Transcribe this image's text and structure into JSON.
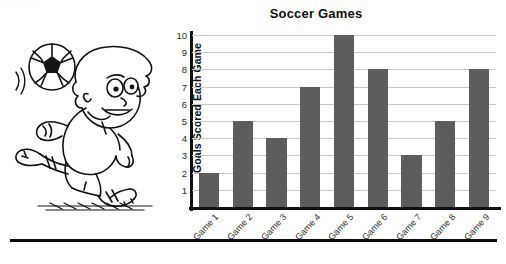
{
  "chart_data": {
    "type": "bar",
    "title": "Soccer Games",
    "xlabel": "",
    "ylabel": "Goals Scored Each Game",
    "categories": [
      "Game 1",
      "Game 2",
      "Game 3",
      "Game 4",
      "Game 5",
      "Game 6",
      "Game 7",
      "Game 8",
      "Game 9"
    ],
    "values": [
      2,
      5,
      4,
      7,
      10,
      8,
      3,
      5,
      8
    ],
    "ylim": [
      0,
      10
    ],
    "ytick_labels": [
      "1",
      "2",
      "3",
      "4",
      "5",
      "6",
      "7",
      "8",
      "9",
      "10"
    ],
    "ytick_values": [
      1,
      2,
      3,
      4,
      5,
      6,
      7,
      8,
      9,
      10
    ],
    "grid": true,
    "legend": false,
    "bar_color": "#5d5d5d",
    "grid_color": "#c9c9c9",
    "axis_color": "#101010"
  },
  "illustration": {
    "name": "soccer-player-line-art",
    "description": "Cartoon boy kicking a soccer ball"
  },
  "scan_artifact": {
    "bleed_text": "·      ·     ·          ·         ·              ·       ·"
  }
}
